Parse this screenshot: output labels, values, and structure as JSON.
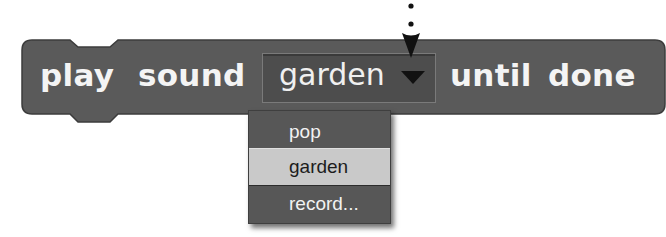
{
  "block": {
    "category": "sound",
    "color": "#5a5a5a",
    "text_before": "play",
    "text_middle": "sound",
    "text_after_1": "until",
    "text_after_2": "done"
  },
  "dropdown": {
    "selected_value": "garden",
    "caret_icon": "triangle-down-icon"
  },
  "pointer": {
    "icon": "dotted-arrow-down-icon"
  },
  "menu": {
    "items": [
      {
        "label": "pop",
        "selected": false
      },
      {
        "label": "garden",
        "selected": true
      },
      {
        "label": "record...",
        "selected": false
      }
    ],
    "highlight_color": "#c9c9c9",
    "background_color": "#575757"
  }
}
